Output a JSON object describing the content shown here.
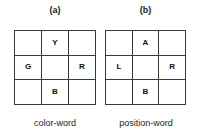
{
  "figure": {
    "background_color": "#ffffff",
    "line_color": "#3a3a3a",
    "text_color": "#1c1c1c"
  },
  "panels": [
    {
      "id": "a",
      "label": "(a)",
      "caption": "color-word",
      "grid": {
        "rows": 3,
        "cols": 3,
        "cells": [
          [
            "",
            "Y",
            ""
          ],
          [
            "G",
            "",
            "R"
          ],
          [
            "",
            "B",
            ""
          ]
        ]
      }
    },
    {
      "id": "b",
      "label": "(b)",
      "caption": "position-word",
      "grid": {
        "rows": 3,
        "cols": 3,
        "cells": [
          [
            "",
            "A",
            ""
          ],
          [
            "L",
            "",
            "R"
          ],
          [
            "",
            "B",
            ""
          ]
        ]
      }
    }
  ]
}
